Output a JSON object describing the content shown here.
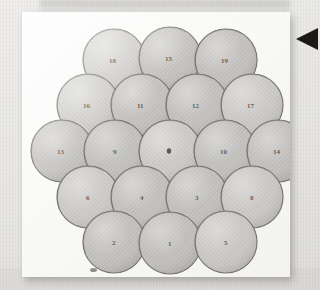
{
  "figure": {
    "sphere_count": 19,
    "rows": [
      {
        "row": 1,
        "count": 3,
        "labels": [
          "18",
          "15",
          "19"
        ]
      },
      {
        "row": 2,
        "count": 4,
        "labels": [
          "16",
          "11",
          "12",
          "17"
        ]
      },
      {
        "row": 3,
        "count": 5,
        "labels": [
          "13",
          "9",
          "",
          "10",
          "14"
        ]
      },
      {
        "row": 4,
        "count": 4,
        "labels": [
          "6",
          "4",
          "3",
          "8"
        ]
      },
      {
        "row": 5,
        "count": 3,
        "labels": [
          "2",
          "1",
          "5"
        ]
      }
    ],
    "spheres": [
      {
        "id": "s18",
        "label": "18",
        "cx": 92,
        "cy": 48,
        "r": 31
      },
      {
        "id": "s15",
        "label": "15",
        "cx": 148,
        "cy": 46,
        "r": 31
      },
      {
        "id": "s19",
        "label": "19",
        "cx": 204,
        "cy": 48,
        "r": 31
      },
      {
        "id": "s16",
        "label": "16",
        "cx": 66,
        "cy": 93,
        "r": 31
      },
      {
        "id": "s11",
        "label": "11",
        "cx": 120,
        "cy": 93,
        "r": 31
      },
      {
        "id": "s12",
        "label": "12",
        "cx": 175,
        "cy": 93,
        "r": 31
      },
      {
        "id": "s17",
        "label": "17",
        "cx": 230,
        "cy": 93,
        "r": 31
      },
      {
        "id": "s13",
        "label": "13",
        "cx": 40,
        "cy": 139,
        "r": 31
      },
      {
        "id": "s9",
        "label": "9",
        "cx": 93,
        "cy": 139,
        "r": 31
      },
      {
        "id": "s0",
        "label": "",
        "cx": 148,
        "cy": 139,
        "r": 31
      },
      {
        "id": "s10",
        "label": "10",
        "cx": 203,
        "cy": 139,
        "r": 31
      },
      {
        "id": "s14",
        "label": "14",
        "cx": 256,
        "cy": 139,
        "r": 31
      },
      {
        "id": "s6",
        "label": "6",
        "cx": 66,
        "cy": 185,
        "r": 31
      },
      {
        "id": "s4",
        "label": "4",
        "cx": 120,
        "cy": 185,
        "r": 31
      },
      {
        "id": "s3",
        "label": "3",
        "cx": 175,
        "cy": 185,
        "r": 31
      },
      {
        "id": "s8",
        "label": "8",
        "cx": 230,
        "cy": 185,
        "r": 31
      },
      {
        "id": "s2",
        "label": "2",
        "cx": 92,
        "cy": 230,
        "r": 31
      },
      {
        "id": "s1",
        "label": "1",
        "cx": 148,
        "cy": 231,
        "r": 31
      },
      {
        "id": "s5",
        "label": "5",
        "cx": 204,
        "cy": 230,
        "r": 31
      }
    ],
    "colors": {
      "sphere_fill": "#a8a6a3",
      "sphere_fill_light": "#c4c2bf",
      "sphere_outline": "#3a3835",
      "label_color": "#181614",
      "plate_background": "#fbfbfa",
      "page_background": "#e9e8e6",
      "arrow_color": "#1c1a18"
    }
  },
  "marker": {
    "arrow_name": "left-pointing arrow",
    "arrow_direction": "left"
  }
}
